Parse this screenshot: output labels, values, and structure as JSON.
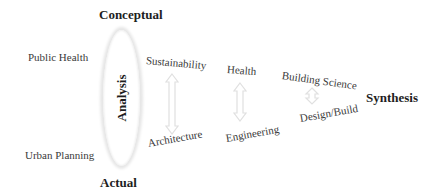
{
  "diagram": {
    "top_label": "Conceptual",
    "bottom_label": "Actual",
    "center_label": "Analysis",
    "right_label": "Synthesis",
    "left_items": [
      "Public Health",
      "Urban Planning"
    ],
    "pairs": [
      {
        "top": "Sustainability",
        "bottom": "Architecture"
      },
      {
        "top": "Health",
        "bottom": "Engineering"
      },
      {
        "top": "Building Science",
        "bottom": "Design/Build"
      }
    ],
    "colors": {
      "text": "#3a3a3a",
      "bold_text": "#1e1e1e",
      "arrow_stroke": "#e0e0e0",
      "ellipse_glow": "#e6e6e6"
    }
  }
}
